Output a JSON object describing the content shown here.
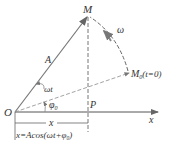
{
  "labels": {
    "M": "M",
    "omega": "ω",
    "A": "A",
    "omega_t": "ωt",
    "phi0": "φ",
    "phi0_sub": "0",
    "O": "O",
    "P": "P",
    "x_axis": "x",
    "M0": "M",
    "M0_sub": "0",
    "M0_cond": "(t=0)",
    "x_span": "x",
    "formula": "x=Acos(ωt+φ",
    "formula_sub": "0",
    "formula_end": ")"
  },
  "colors": {
    "line": "#555555",
    "dashed": "#888888",
    "text": "#333333"
  }
}
